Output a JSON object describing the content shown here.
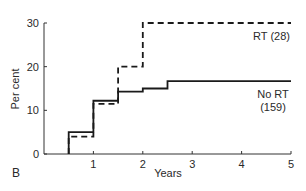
{
  "chart_data": {
    "type": "line",
    "step": true,
    "panel_label": "B",
    "title": "",
    "xlabel": "Years",
    "ylabel": "Per cent",
    "xlim": [
      0,
      5
    ],
    "ylim": [
      0,
      30
    ],
    "xticks": [
      1,
      2,
      3,
      4,
      5
    ],
    "yticks": [
      0,
      10,
      20,
      30
    ],
    "grid": false,
    "legend_position": "inline labels at right",
    "series": [
      {
        "name": "RT (28)",
        "label_lines": [
          "RT (28)"
        ],
        "style": "dashed",
        "color": "#1a1a1a",
        "x": [
          0.5,
          1.0,
          1.5,
          2.0,
          5.0
        ],
        "y": [
          4,
          11.5,
          20,
          30,
          30
        ]
      },
      {
        "name": "No RT (159)",
        "label_lines": [
          "No RT",
          "(159)"
        ],
        "style": "solid",
        "color": "#1a1a1a",
        "x": [
          0.5,
          1.0,
          1.5,
          2.0,
          2.5,
          5.0
        ],
        "y": [
          5,
          12.2,
          14.3,
          15.0,
          16.7,
          16.7
        ]
      }
    ]
  }
}
